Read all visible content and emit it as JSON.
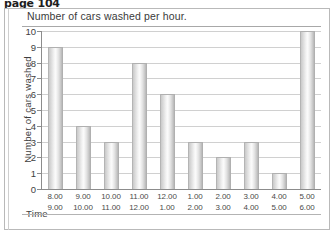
{
  "page": {
    "header_label": "page 104"
  },
  "chart_data": {
    "type": "bar",
    "title": "Number of cars washed per hour.",
    "xlabel": "Time",
    "ylabel": "Number of cars washed",
    "ylim": [
      0,
      10
    ],
    "grid": true,
    "legend": "none",
    "categories": [
      "8.00\n9.00",
      "9.00\n10.00",
      "10.00\n11.00",
      "11.00\n12.00",
      "12.00\n1.00",
      "1.00\n2.00",
      "2.00\n3.00",
      "3.00\n4.00",
      "4.00\n5.00",
      "5.00\n6.00"
    ],
    "category_lines": [
      {
        "start": "8.00",
        "end": "9.00"
      },
      {
        "start": "9.00",
        "end": "10.00"
      },
      {
        "start": "10.00",
        "end": "11.00"
      },
      {
        "start": "11.00",
        "end": "12.00"
      },
      {
        "start": "12.00",
        "end": "1.00"
      },
      {
        "start": "1.00",
        "end": "2.00"
      },
      {
        "start": "2.00",
        "end": "3.00"
      },
      {
        "start": "3.00",
        "end": "4.00"
      },
      {
        "start": "4.00",
        "end": "5.00"
      },
      {
        "start": "5.00",
        "end": "6.00"
      }
    ],
    "values": [
      9,
      4,
      3,
      8,
      6,
      3,
      2,
      3,
      1,
      10
    ],
    "ytick_labels": [
      "0",
      "1",
      "2",
      "3",
      "4",
      "5",
      "6",
      "7",
      "8",
      "9",
      "10"
    ],
    "colors": {
      "bar_fill": "#e6e6e6",
      "bar_edge": "#b2b2b2",
      "gridline": "#d0d0d0",
      "axis": "#8c8c8c",
      "text": "#3e3e3e"
    }
  }
}
